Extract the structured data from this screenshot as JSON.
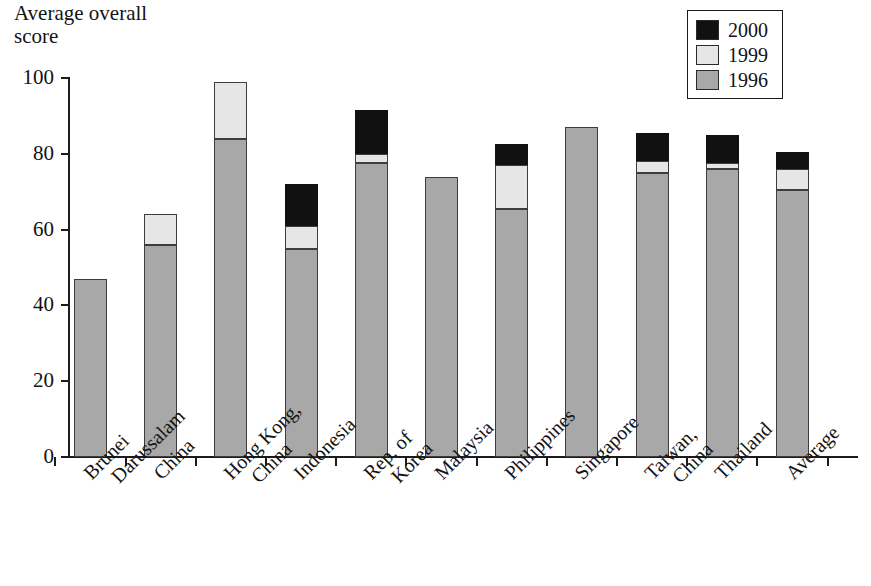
{
  "title": "Average overall\nscore",
  "title_line1": "Average overall",
  "title_line2": "score",
  "legend": {
    "items": [
      {
        "label": "2000",
        "color": "#111111"
      },
      {
        "label": "1999",
        "color": "#e6e6e6"
      },
      {
        "label": "1996",
        "color": "#a8a8a8"
      }
    ]
  },
  "axis": {
    "y_ticks": [
      "0",
      "20",
      "40",
      "60",
      "80",
      "100"
    ],
    "y_min": 0,
    "y_max": 100
  },
  "chart_data": {
    "type": "bar",
    "title": "Average overall score",
    "xlabel": "",
    "ylabel": "Average overall score",
    "ylim": [
      0,
      100
    ],
    "grid": false,
    "legend_position": "top-right",
    "stacked": false,
    "note": "Each economy shows the latest reported value per survey year; shorter later-year bars are drawn in front of the taller earlier-year bar, producing a layered column.",
    "categories": [
      "Brunei Darussalam",
      "China",
      "Hong Kong, China",
      "Indonesia",
      "Rep. of Korea",
      "Malaysia",
      "Philippines",
      "Singapore",
      "Taiwan, China",
      "Thailand",
      "Average"
    ],
    "category_lines": [
      [
        "Brunei",
        "Darussalam"
      ],
      [
        "China",
        ""
      ],
      [
        "Hong Kong,",
        "China"
      ],
      [
        "Indonesia",
        ""
      ],
      [
        "Rep. of",
        "Korea"
      ],
      [
        "Malaysia",
        ""
      ],
      [
        "Philippines",
        ""
      ],
      [
        "Singapore",
        ""
      ],
      [
        "Taiwan,",
        "China"
      ],
      [
        "Thailand",
        ""
      ],
      [
        "Average",
        ""
      ]
    ],
    "series": [
      {
        "name": "1996",
        "color": "#a8a8a8",
        "values": [
          47,
          56,
          84,
          55,
          77.5,
          74,
          65.5,
          87,
          75,
          76,
          70.5
        ]
      },
      {
        "name": "1999",
        "color": "#e6e6e6",
        "values": [
          null,
          64,
          99,
          61,
          80,
          null,
          77,
          null,
          78,
          77.5,
          76
        ]
      },
      {
        "name": "2000",
        "color": "#111111",
        "values": [
          null,
          null,
          null,
          72,
          91.5,
          null,
          82.5,
          null,
          85.5,
          85,
          80.5
        ]
      }
    ]
  }
}
